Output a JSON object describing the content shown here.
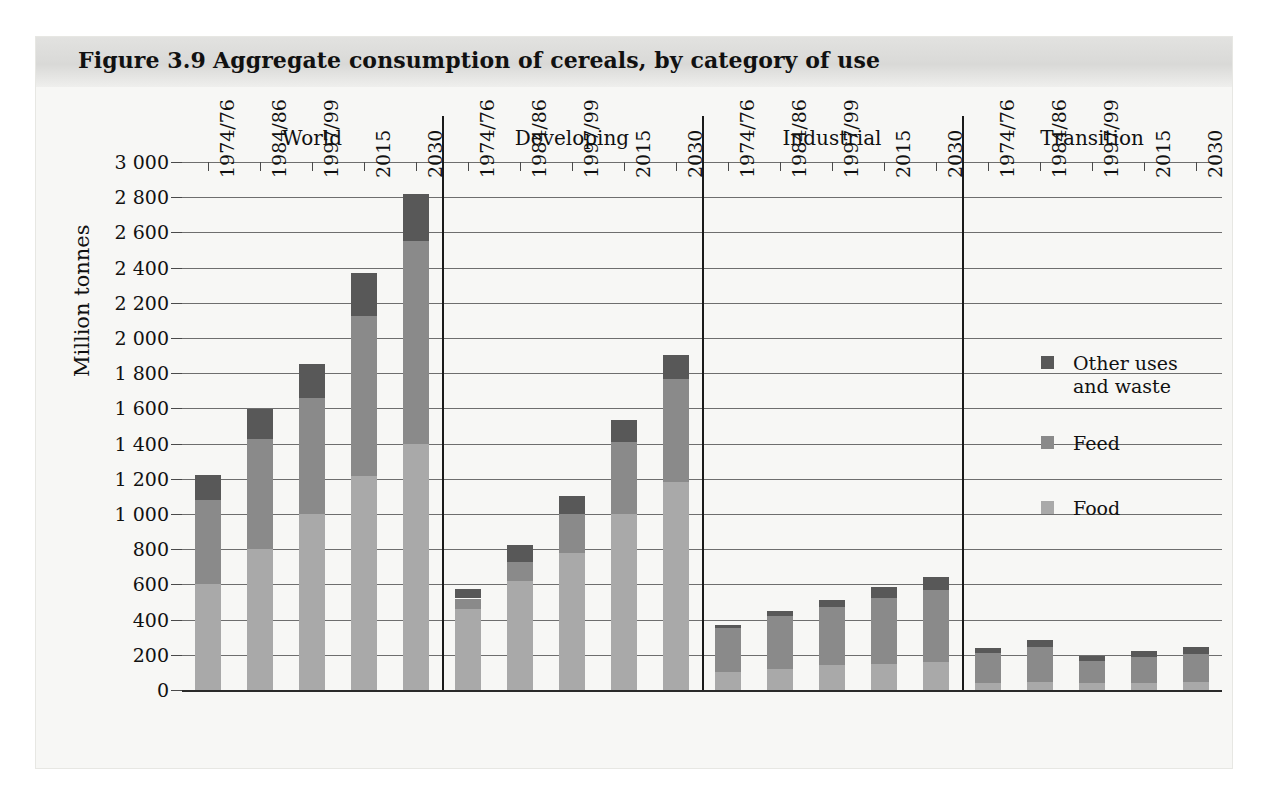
{
  "figure": {
    "number": "Figure 3.9",
    "title": "Aggregate consumption of cereals, by category of use"
  },
  "axis": {
    "ylabel": "Million tonnes",
    "yticks": [
      "0",
      "200",
      "400",
      "600",
      "800",
      "1 000",
      "1 200",
      "1 400",
      "1 600",
      "1 800",
      "2 000",
      "2 200",
      "2 400",
      "2 600",
      "2 800",
      "3 000"
    ]
  },
  "legend": {
    "items": [
      {
        "label": "Other uses\nand waste",
        "label_line1": "Other uses",
        "label_line2": "and waste",
        "color": "#585858",
        "key": "other"
      },
      {
        "label": "Feed",
        "color": "#8a8a8a",
        "key": "feed"
      },
      {
        "label": "Food",
        "color": "#a9a9a9",
        "key": "food"
      }
    ]
  },
  "chart_data": {
    "type": "bar",
    "subtype": "stacked-grouped",
    "title": "Aggregate consumption of cereals, by category of use",
    "xlabel": "",
    "ylabel": "Million tonnes",
    "ylim": [
      0,
      3000
    ],
    "ytick_step": 200,
    "grid": true,
    "legend_position": "right",
    "group_names": [
      "World",
      "Developing",
      "Industrial",
      "Transition"
    ],
    "categories": [
      "1974/76",
      "1984/86",
      "1997/99",
      "2015",
      "2030"
    ],
    "series": [
      {
        "name": "Food",
        "color": "#a9a9a9"
      },
      {
        "name": "Feed",
        "color": "#8a8a8a"
      },
      {
        "name": "Other uses and waste",
        "color": "#585858"
      }
    ],
    "groups": [
      {
        "name": "World",
        "bars": [
          {
            "category": "1974/76",
            "food": 600,
            "feed": 480,
            "other": 140,
            "total": 1220
          },
          {
            "category": "1984/86",
            "food": 800,
            "feed": 625,
            "other": 170,
            "total": 1595
          },
          {
            "category": "1997/99",
            "food": 1000,
            "feed": 660,
            "other": 190,
            "total": 1850
          },
          {
            "category": "2015",
            "food": 1215,
            "feed": 910,
            "other": 245,
            "total": 2370
          },
          {
            "category": "2030",
            "food": 1400,
            "feed": 1150,
            "other": 270,
            "total": 2820
          }
        ]
      },
      {
        "name": "Developing",
        "bars": [
          {
            "category": "1974/76",
            "food": 460,
            "feed": 60,
            "other": 55,
            "total": 575
          },
          {
            "category": "1984/86",
            "food": 620,
            "feed": 110,
            "other": 95,
            "total": 825
          },
          {
            "category": "1997/99",
            "food": 780,
            "feed": 220,
            "other": 105,
            "total": 1105
          },
          {
            "category": "2015",
            "food": 1000,
            "feed": 410,
            "other": 125,
            "total": 1535
          },
          {
            "category": "2030",
            "food": 1180,
            "feed": 585,
            "other": 140,
            "total": 1905
          }
        ]
      },
      {
        "name": "Industrial",
        "bars": [
          {
            "category": "1974/76",
            "food": 105,
            "feed": 250,
            "other": 15,
            "total": 370
          },
          {
            "category": "1984/86",
            "food": 120,
            "feed": 300,
            "other": 30,
            "total": 450
          },
          {
            "category": "1997/99",
            "food": 140,
            "feed": 330,
            "other": 40,
            "total": 510
          },
          {
            "category": "2015",
            "food": 150,
            "feed": 375,
            "other": 60,
            "total": 585
          },
          {
            "category": "2030",
            "food": 160,
            "feed": 410,
            "other": 70,
            "total": 640
          }
        ]
      },
      {
        "name": "Transition",
        "bars": [
          {
            "category": "1974/76",
            "food": 40,
            "feed": 170,
            "other": 30,
            "total": 240
          },
          {
            "category": "1984/86",
            "food": 45,
            "feed": 200,
            "other": 40,
            "total": 285
          },
          {
            "category": "1997/99",
            "food": 40,
            "feed": 125,
            "other": 30,
            "total": 195
          },
          {
            "category": "2015",
            "food": 40,
            "feed": 145,
            "other": 35,
            "total": 220
          },
          {
            "category": "2030",
            "food": 45,
            "feed": 160,
            "other": 40,
            "total": 245
          }
        ]
      }
    ]
  }
}
